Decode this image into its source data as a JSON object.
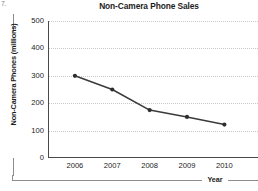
{
  "problem_number": "7.",
  "chart_data": {
    "type": "line",
    "title": "Non-Camera Phone Sales",
    "xlabel": "Year",
    "ylabel": "Non-Camera Phones (millions)",
    "categories": [
      "2006",
      "2007",
      "2008",
      "2009",
      "2010"
    ],
    "values": [
      300,
      250,
      175,
      150,
      122
    ],
    "series": [
      {
        "name": "Non-Camera Phones",
        "values": [
          300,
          250,
          175,
          150,
          122
        ]
      }
    ],
    "ylim": [
      0,
      500
    ],
    "yticks": [
      0,
      100,
      200,
      300,
      400,
      500
    ],
    "ytick_labels": [
      "0",
      "100",
      "200",
      "300",
      "400",
      "500"
    ],
    "xtick_labels": [
      "2006",
      "2007",
      "2008",
      "2009",
      "2010"
    ],
    "grid": true,
    "grid_axis": "y",
    "grid_style": "dotted",
    "legend": false,
    "legend_position": "none",
    "marker": "circle",
    "colors": {
      "line": "#3a3a3a",
      "marker": "#2e2e2e",
      "grid": "#c9c9c9",
      "axis": "#4a4a4a",
      "text": "#1d1d1d",
      "background": "#ffffff"
    }
  }
}
